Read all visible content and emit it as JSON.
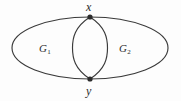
{
  "figure": {
    "type": "graph-diagram",
    "background_color": "#fdfdfd",
    "stroke_color": "#3a3a3a",
    "text_color": "#2b2b2b",
    "vertices": [
      {
        "id": "x",
        "label": "x",
        "cx": 90,
        "cy": 17,
        "radius": 2.6
      },
      {
        "id": "y",
        "label": "y",
        "cx": 90,
        "cy": 79,
        "radius": 2.6
      }
    ],
    "regions": [
      {
        "id": "g1",
        "letter": "G",
        "subscript": "1",
        "x": 46,
        "y": 48
      },
      {
        "id": "g2",
        "letter": "G",
        "subscript": "2",
        "x": 126,
        "y": 48
      }
    ],
    "outer_ellipse": {
      "cx": 90,
      "cy": 48,
      "rx": 78,
      "ry": 31
    },
    "lens": {
      "cx": 90,
      "half_width": 17.5,
      "top_y": 17,
      "bottom_y": 79
    }
  }
}
